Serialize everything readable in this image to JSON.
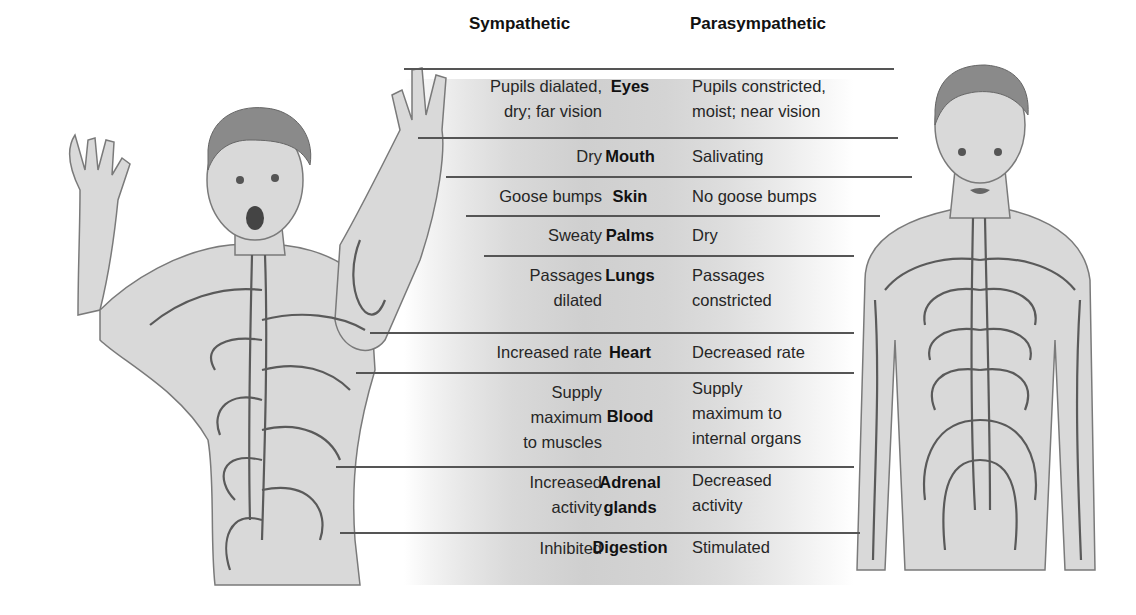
{
  "headers": {
    "sympathetic": "Sympathetic",
    "parasympathetic": "Parasympathetic"
  },
  "rows": [
    {
      "organ": "Eyes",
      "sympathetic": [
        "Pupils dialated,",
        "dry; far vision"
      ],
      "parasympathetic": [
        "Pupils constricted,",
        "moist; near vision"
      ]
    },
    {
      "organ": "Mouth",
      "sympathetic": [
        "Dry"
      ],
      "parasympathetic": [
        "Salivating"
      ]
    },
    {
      "organ": "Skin",
      "sympathetic": [
        "Goose bumps"
      ],
      "parasympathetic": [
        "No goose bumps"
      ]
    },
    {
      "organ": "Palms",
      "sympathetic": [
        "Sweaty"
      ],
      "parasympathetic": [
        "Dry"
      ]
    },
    {
      "organ": "Lungs",
      "sympathetic": [
        "Passages",
        "dilated"
      ],
      "parasympathetic": [
        "Passages",
        "constricted"
      ]
    },
    {
      "organ": "Heart",
      "sympathetic": [
        "Increased rate"
      ],
      "parasympathetic": [
        "Decreased rate"
      ]
    },
    {
      "organ": "Blood",
      "sympathetic": [
        "Supply",
        "maximum",
        "to muscles"
      ],
      "parasympathetic": [
        "Supply",
        "maximum to",
        "internal organs"
      ]
    },
    {
      "organ": [
        "Adrenal",
        "glands"
      ],
      "sympathetic": [
        "Increased",
        "activity"
      ],
      "parasympathetic": [
        "Decreased",
        "activity"
      ]
    },
    {
      "organ": "Digestion",
      "sympathetic": [
        "Inhibited"
      ],
      "parasympathetic": [
        "Stimulated"
      ]
    }
  ],
  "figures": {
    "left": "sympathetic-aroused-figure",
    "right": "parasympathetic-calm-figure"
  },
  "colors": {
    "line": "#555555",
    "panel_mid": "#cfcfcf",
    "text": "#222222"
  }
}
